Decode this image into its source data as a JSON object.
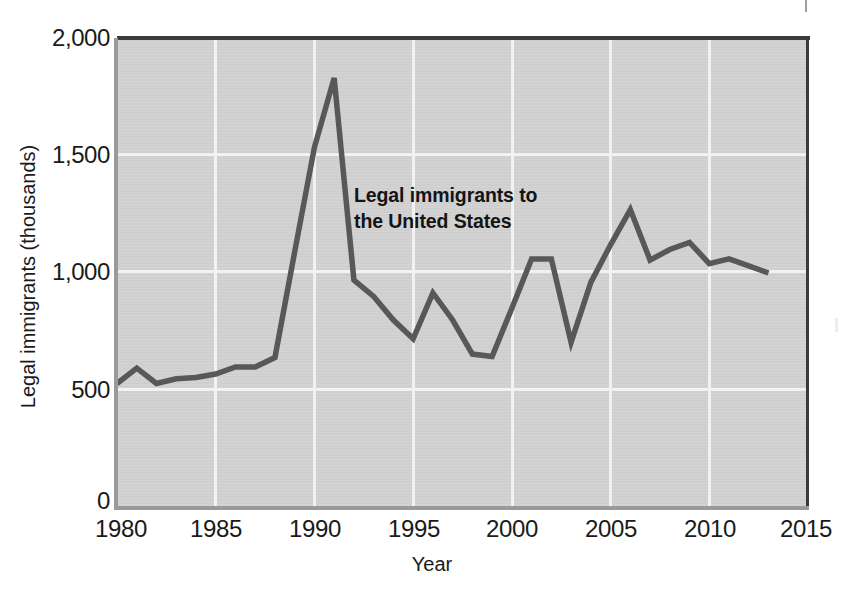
{
  "chart_data": {
    "type": "line",
    "title": "",
    "xlabel": "Year",
    "ylabel": "Legal immigrants (thousands)",
    "xlim": [
      1980,
      2015
    ],
    "ylim": [
      0,
      2000
    ],
    "grid": true,
    "legend": "none",
    "annotation": "Legal immigrants to\nthe United States",
    "annotation_line_1": "Legal immigrants to",
    "annotation_line_2": "the United States",
    "series_name": "Legal immigrants to the United States",
    "line_color": "#585858",
    "plot_background": "#d4d4d4",
    "gridline_color": "#f2f2f2",
    "x_ticks": [
      1980,
      1985,
      1990,
      1995,
      2000,
      2005,
      2010,
      2015
    ],
    "x_tick_labels": [
      "1980",
      "1985",
      "1990",
      "1995",
      "2000",
      "2005",
      "2010",
      "2015"
    ],
    "y_ticks": [
      0,
      500,
      1000,
      1500,
      2000
    ],
    "y_tick_labels": [
      "0",
      "500",
      "1,000",
      "1,500",
      "2,000"
    ],
    "x": [
      1980,
      1981,
      1982,
      1983,
      1984,
      1985,
      1986,
      1987,
      1988,
      1989,
      1990,
      1991,
      1992,
      1993,
      1994,
      1995,
      1996,
      1997,
      1998,
      1999,
      2000,
      2001,
      2002,
      2003,
      2004,
      2005,
      2006,
      2007,
      2008,
      2009,
      2010,
      2011,
      2012,
      2013
    ],
    "values": [
      530,
      595,
      530,
      550,
      555,
      570,
      600,
      600,
      640,
      1090,
      1535,
      1830,
      970,
      900,
      800,
      720,
      915,
      800,
      655,
      645,
      850,
      1060,
      1060,
      705,
      960,
      1120,
      1270,
      1055,
      1100,
      1130,
      1040,
      1060,
      1030,
      1000
    ]
  }
}
